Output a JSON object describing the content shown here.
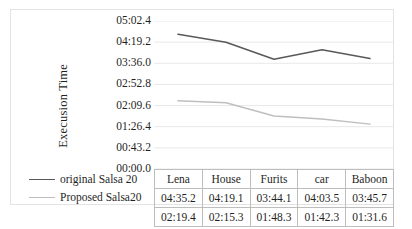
{
  "chart_data": {
    "type": "line",
    "title": "",
    "xlabel": "",
    "ylabel": "Execusion Time",
    "categories": [
      "Lena",
      "House",
      "Furits",
      "car",
      "Baboon"
    ],
    "ytick_labels": [
      "00:00.0",
      "00:43.2",
      "01:26.4",
      "02:09.6",
      "02:52.8",
      "03:36.0",
      "04:19.2",
      "05:02.4"
    ],
    "ytick_seconds": [
      0,
      43.2,
      86.4,
      129.6,
      172.8,
      216.0,
      259.2,
      302.4
    ],
    "ylim_seconds": [
      0,
      302.4
    ],
    "grid": true,
    "legend_position": "left-bottom",
    "series": [
      {
        "name": "original Salsa 20",
        "color": "#595959",
        "values": [
          "04:35.2",
          "04:19.1",
          "03:44.1",
          "04:03.5",
          "03:45.7"
        ],
        "seconds": [
          275.2,
          259.1,
          224.1,
          243.5,
          225.7
        ]
      },
      {
        "name": "Proposed Salsa20",
        "color": "#bfbfbf",
        "values": [
          "02:19.4",
          "02:15.3",
          "01:48.3",
          "01:42.3",
          "01:31.6"
        ],
        "seconds": [
          139.4,
          135.3,
          108.3,
          102.3,
          91.6
        ]
      }
    ]
  },
  "table": {
    "header_row": [
      "",
      "Lena",
      "House",
      "Furits",
      "car",
      "Baboon"
    ],
    "rows": [
      {
        "label": "original Salsa 20",
        "cells": [
          "04:35.2",
          "04:19.1",
          "03:44.1",
          "04:03.5",
          "03:45.7"
        ]
      },
      {
        "label": "Proposed Salsa20",
        "cells": [
          "02:19.4",
          "02:15.3",
          "01:48.3",
          "01:42.3",
          "01:31.6"
        ]
      }
    ]
  }
}
